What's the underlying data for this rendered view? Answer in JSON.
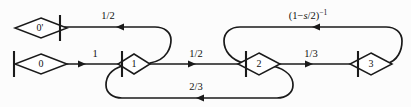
{
  "diagram": {
    "type": "signal-flow-graph",
    "title": "",
    "stroke_color": "#1a1a1a",
    "background_color": "#fcfcfc",
    "nodes": [
      {
        "id": "n0p",
        "label": "0'",
        "x": 41,
        "y": 28,
        "bar_side": "right"
      },
      {
        "id": "n0",
        "label": "0",
        "x": 41,
        "y": 64,
        "bar_side": "left"
      },
      {
        "id": "n1",
        "label": "1",
        "x": 134,
        "y": 64,
        "bar_side": "left"
      },
      {
        "id": "n2",
        "label": "2",
        "x": 258,
        "y": 64,
        "bar_side": "left"
      },
      {
        "id": "n3",
        "label": "3",
        "x": 370,
        "y": 64,
        "bar_side": "left"
      }
    ],
    "edges": [
      {
        "id": "e0_1",
        "from": "0",
        "to": "1",
        "label": "1",
        "label_x": 95,
        "label_y": 57,
        "direction": "right"
      },
      {
        "id": "e1_0p",
        "from": "1",
        "to": "0'",
        "label": "1/2",
        "label_x": 108,
        "label_y": 19,
        "direction": "left"
      },
      {
        "id": "e1_2",
        "from": "1",
        "to": "2",
        "label": "1/2",
        "label_x": 195,
        "label_y": 57,
        "direction": "right"
      },
      {
        "id": "e2_1",
        "from": "2",
        "to": "1",
        "label": "2/3",
        "label_x": 190,
        "label_y": 90,
        "direction": "left"
      },
      {
        "id": "e2_3",
        "from": "2",
        "to": "3",
        "label": "1/3",
        "label_x": 310,
        "label_y": 57,
        "direction": "right"
      },
      {
        "id": "e3_2",
        "from": "3",
        "to": "2",
        "label": "(1-s/2)^-1",
        "label_x": 308,
        "label_y": 19,
        "direction": "left",
        "label_parts": {
          "pre": "(1−",
          "ital": "s",
          "mid": "/2)",
          "sup": "−1"
        }
      }
    ],
    "labels": {
      "node_0_prime": "0'",
      "node_0": "0",
      "node_1": "1",
      "node_2": "2",
      "node_3": "3",
      "edge_one": "1",
      "edge_half_top": "1/2",
      "edge_half_mid": "1/2",
      "edge_two_thirds": "2/3",
      "edge_one_third": "1/3",
      "edge_expr_pre": "(1−",
      "edge_expr_ital": "s",
      "edge_expr_mid": "/2)",
      "edge_expr_sup": "−1"
    }
  }
}
